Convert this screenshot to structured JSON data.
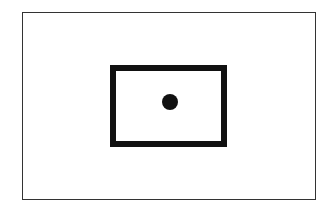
{
  "diagram": {
    "shapes": [
      {
        "type": "rectangle",
        "role": "outer-frame",
        "stroke": "#333333",
        "stroke_width": 1
      },
      {
        "type": "rectangle",
        "role": "inner-box",
        "stroke": "#111111",
        "stroke_width": 6
      },
      {
        "type": "circle",
        "role": "dot",
        "fill": "#111111"
      }
    ]
  }
}
